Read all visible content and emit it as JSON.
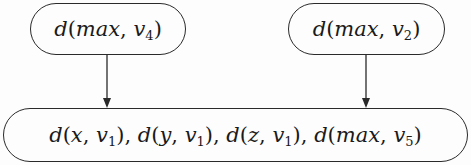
{
  "diagram": {
    "type": "directed-graph",
    "nodes": [
      {
        "id": "n1",
        "label": "d(max, v4)",
        "parts": {
          "fn": "d",
          "arg1": "max",
          "var": "v",
          "sub": "4"
        }
      },
      {
        "id": "n2",
        "label": "d(max, v2)",
        "parts": {
          "fn": "d",
          "arg1": "max",
          "var": "v",
          "sub": "2"
        }
      },
      {
        "id": "n3",
        "label": "d(x, v1), d(y, v1), d(z, v1), d(max, v5)",
        "terms": [
          {
            "fn": "d",
            "arg1": "x",
            "var": "v",
            "sub": "1"
          },
          {
            "fn": "d",
            "arg1": "y",
            "var": "v",
            "sub": "1"
          },
          {
            "fn": "d",
            "arg1": "z",
            "var": "v",
            "sub": "1"
          },
          {
            "fn": "d",
            "arg1": "max",
            "var": "v",
            "sub": "5"
          }
        ]
      }
    ],
    "edges": [
      {
        "from": "n1",
        "to": "n3"
      },
      {
        "from": "n2",
        "to": "n3"
      }
    ],
    "colors": {
      "stroke": "#2a2a2a",
      "text": "#1a1a1a",
      "background": "#fdfdfd"
    }
  }
}
